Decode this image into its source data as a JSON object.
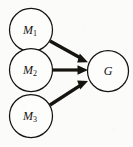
{
  "diagram": {
    "type": "directed-graph",
    "background_color": "#fbfbfa",
    "stroke_color": "#16140f",
    "node_fill_color": "#fdfdfc",
    "nodes": [
      {
        "id": "m1",
        "label": "M",
        "subscript": "1",
        "cx": 31,
        "cy": 30,
        "r": 21.5
      },
      {
        "id": "m2",
        "label": "M",
        "subscript": "2",
        "cx": 31,
        "cy": 70,
        "r": 21.5
      },
      {
        "id": "m3",
        "label": "M",
        "subscript": "3",
        "cx": 31,
        "cy": 116,
        "r": 21.5
      },
      {
        "id": "g",
        "label": "G",
        "subscript": "",
        "cx": 108,
        "cy": 71,
        "r": 20.5
      }
    ],
    "edges": [
      {
        "id": "m1-to-g",
        "from": "M1",
        "to": "G",
        "from_x": 50,
        "from_y": 41,
        "to_x": 87,
        "to_y": 61,
        "width": 3.4
      },
      {
        "id": "m2-to-g",
        "from": "M2",
        "to": "G",
        "from_x": 53,
        "from_y": 70,
        "to_x": 87,
        "to_y": 70,
        "width": 3.2
      },
      {
        "id": "m3-to-g",
        "from": "M3",
        "to": "G",
        "from_x": 50,
        "from_y": 105,
        "to_x": 87,
        "to_y": 82,
        "width": 3.4
      }
    ]
  }
}
